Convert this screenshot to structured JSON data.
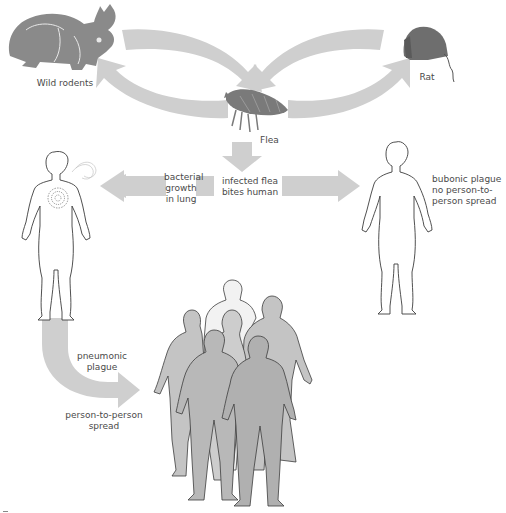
{
  "diagram": {
    "colors": {
      "background": "#ffffff",
      "arrow": "#cfcfcf",
      "animal": "#8a8a8a",
      "human_outline": "#3c3c3c",
      "human_fill": "#ffffff",
      "crowd_fill": "#bdbdbd",
      "text": "#4a4a4a"
    },
    "nodes": {
      "wild_rodents": {
        "label": "Wild rodents",
        "icon": "rabbit-icon"
      },
      "rat": {
        "label": "Rat",
        "icon": "rat-icon"
      },
      "flea": {
        "label": "Flea",
        "icon": "flea-icon"
      },
      "infected_flea": {
        "lines": [
          "infected flea",
          "bites human"
        ]
      },
      "bacterial_growth": {
        "lines": [
          "bacterial",
          "growth",
          "in lung"
        ]
      },
      "bubonic": {
        "lines": [
          "bubonic plague",
          "no person-to-",
          "person spread"
        ]
      },
      "pneumonic": {
        "lines": [
          "pneumonic",
          "plague"
        ]
      },
      "person_spread": {
        "lines": [
          "person-to-person",
          "spread"
        ]
      }
    },
    "figures": {
      "pneumonic_patient": "human-figure-with-lung-infection",
      "bubonic_patient": "human-figure",
      "crowd": "crowd-of-humans"
    }
  }
}
